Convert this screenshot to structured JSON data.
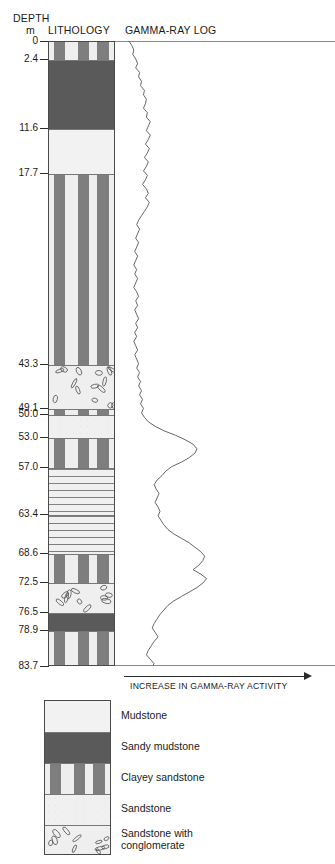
{
  "headers": {
    "depth_title": "DEPTH",
    "depth_unit": "m",
    "lithology_title": "LITHOLOGY",
    "gamma_title": "GAMMA-RAY LOG"
  },
  "axis": {
    "bottom_label": "INCREASE IN GAMMA-RAY ACTIVITY",
    "arrow_icon": "arrow-right-icon"
  },
  "depth_scale": {
    "unit": "m",
    "min": 0,
    "max": 83.7,
    "ticks": [
      "0",
      "2.4",
      "11.6",
      "17.7",
      "43.3",
      "49.1",
      "50.0",
      "53.0",
      "57.0",
      "63.4",
      "68.6",
      "72.5",
      "76.5",
      "78.9",
      "83.7"
    ]
  },
  "lithology": {
    "beds": [
      {
        "top": 0,
        "base": 2.4,
        "type": "Clayey sandstone"
      },
      {
        "top": 2.4,
        "base": 11.6,
        "type": "Sandy mudstone"
      },
      {
        "top": 11.6,
        "base": 17.7,
        "type": "Mudstone"
      },
      {
        "top": 17.7,
        "base": 43.3,
        "type": "Clayey sandstone"
      },
      {
        "top": 43.3,
        "base": 49.1,
        "type": "Sandstone with conglomerate"
      },
      {
        "top": 49.1,
        "base": 50.0,
        "type": "Clayey sandstone"
      },
      {
        "top": 50.0,
        "base": 53.0,
        "type": "Sandstone"
      },
      {
        "top": 53.0,
        "base": 57.0,
        "type": "Clayey sandstone"
      },
      {
        "top": 57.0,
        "base": 63.4,
        "type": "Sandstone"
      },
      {
        "top": 63.4,
        "base": 68.6,
        "type": "Sandstone"
      },
      {
        "top": 68.6,
        "base": 72.5,
        "type": "Clayey sandstone"
      },
      {
        "top": 72.5,
        "base": 76.5,
        "type": "Sandstone with conglomerate"
      },
      {
        "top": 76.5,
        "base": 78.9,
        "type": "Sandy mudstone"
      },
      {
        "top": 78.9,
        "base": 83.7,
        "type": "Clayey sandstone"
      }
    ]
  },
  "legend": {
    "items": [
      {
        "label": "Mudstone",
        "pattern": "mudstone"
      },
      {
        "label": "Sandy mudstone",
        "pattern": "sandy-mudstone"
      },
      {
        "label": "Clayey sandstone",
        "pattern": "clayey-sandstone"
      },
      {
        "label": "Sandstone",
        "pattern": "sandstone"
      },
      {
        "label": "Sandstone with\nconglomerate",
        "pattern": "sandstone-conglomerate"
      }
    ]
  },
  "colors": {
    "mudstone": "#f2f2f2",
    "sandy_mudstone": "#5a5a5a",
    "clayey_sandstone": "#eeeeee",
    "sandstone": "#f0f0f0",
    "conglomerate": "#efefef",
    "curve": "#555555",
    "outline": "#4a4a4a",
    "text": "#1a1a1a"
  },
  "chart_data": {
    "type": "line",
    "title": "GAMMA-RAY LOG",
    "xlabel": "INCREASE IN GAMMA-RAY ACTIVITY",
    "ylabel": "DEPTH (m)",
    "ylim": [
      0,
      83.7
    ],
    "xlim": [
      0,
      100
    ],
    "y_inverted": true,
    "grid": false,
    "legend_position": "none",
    "series": [
      {
        "name": "Gamma-ray",
        "depth_m": [
          0.0,
          0.6,
          1.2,
          1.8,
          2.4,
          3.0,
          3.6,
          4.2,
          4.8,
          5.4,
          6.0,
          6.6,
          7.2,
          7.8,
          8.4,
          9.0,
          9.6,
          10.2,
          10.8,
          11.4,
          12.0,
          12.6,
          13.2,
          13.8,
          14.4,
          15.0,
          15.6,
          16.2,
          16.8,
          17.4,
          18.0,
          18.6,
          19.2,
          19.8,
          20.4,
          21.0,
          21.6,
          22.2,
          22.8,
          23.4,
          24.0,
          24.6,
          25.2,
          25.8,
          26.4,
          27.0,
          27.6,
          28.2,
          28.8,
          29.4,
          30.0,
          30.6,
          31.2,
          31.8,
          32.4,
          33.0,
          33.6,
          34.2,
          34.8,
          35.4,
          36.0,
          36.6,
          37.2,
          37.8,
          38.4,
          39.0,
          39.6,
          40.2,
          40.8,
          41.4,
          42.0,
          42.6,
          43.2,
          43.8,
          44.4,
          45.0,
          45.6,
          46.2,
          46.8,
          47.4,
          48.0,
          48.6,
          49.2,
          49.8,
          50.4,
          51.0,
          51.6,
          52.2,
          52.8,
          53.4,
          54.0,
          54.6,
          55.2,
          55.8,
          56.4,
          57.0,
          57.6,
          58.2,
          58.8,
          59.4,
          60.0,
          60.6,
          61.2,
          61.8,
          62.4,
          63.0,
          63.6,
          64.2,
          64.8,
          65.4,
          66.0,
          66.6,
          67.2,
          67.8,
          68.4,
          69.0,
          69.6,
          70.2,
          70.8,
          71.4,
          72.0,
          72.6,
          73.2,
          73.8,
          74.4,
          75.0,
          75.6,
          76.2,
          76.8,
          77.4,
          78.0,
          78.6,
          79.2,
          79.8,
          80.4,
          81.0,
          81.6,
          82.2,
          82.8,
          83.4,
          83.7
        ],
        "values": [
          4,
          7,
          9,
          8,
          11,
          13,
          11,
          15,
          14,
          17,
          16,
          20,
          19,
          22,
          21,
          19,
          23,
          22,
          26,
          24,
          22,
          26,
          24,
          21,
          25,
          23,
          20,
          24,
          22,
          19,
          23,
          21,
          18,
          22,
          24,
          21,
          25,
          23,
          20,
          17,
          14,
          12,
          15,
          13,
          11,
          14,
          12,
          10,
          13,
          11,
          9,
          12,
          10,
          13,
          11,
          9,
          12,
          14,
          11,
          13,
          10,
          12,
          14,
          11,
          13,
          10,
          12,
          9,
          11,
          13,
          10,
          12,
          14,
          12,
          15,
          13,
          16,
          14,
          17,
          15,
          18,
          16,
          19,
          17,
          20,
          24,
          31,
          40,
          52,
          62,
          70,
          74,
          72,
          66,
          58,
          48,
          42,
          38,
          33,
          30,
          32,
          35,
          33,
          31,
          34,
          36,
          34,
          37,
          40,
          44,
          50,
          58,
          66,
          72,
          78,
          82,
          80,
          76,
          70,
          78,
          84,
          80,
          74,
          66,
          58,
          50,
          44,
          40,
          36,
          33,
          30,
          28,
          31,
          34,
          30,
          27,
          24,
          22,
          26,
          30,
          28,
          32,
          30,
          26,
          22,
          24,
          28,
          26,
          30,
          34,
          32,
          36,
          40,
          44,
          42,
          46,
          50,
          54,
          58,
          62,
          60,
          56,
          52,
          48,
          44,
          40,
          36,
          32,
          28,
          26,
          30,
          34,
          38,
          42,
          46,
          50,
          48,
          52,
          56,
          60,
          58,
          54,
          50,
          46,
          42,
          38,
          34,
          30,
          26,
          22,
          20,
          24,
          28,
          32,
          36,
          40,
          38,
          42,
          46,
          50,
          48,
          44,
          40,
          36,
          32,
          28,
          26,
          30,
          34,
          38,
          36,
          40,
          44,
          42,
          46,
          50,
          48,
          44,
          40,
          36,
          34,
          38,
          42,
          46,
          44,
          48,
          52,
          50,
          46,
          42,
          38,
          34,
          30,
          28,
          32,
          36,
          40,
          38,
          42,
          46,
          44,
          40,
          36,
          32,
          30,
          34,
          38,
          42,
          40,
          44,
          48,
          46,
          42,
          38,
          34,
          32,
          36,
          40,
          44,
          42,
          46,
          50,
          48,
          44,
          40,
          36,
          34,
          30,
          28,
          32,
          36,
          34,
          38,
          42,
          40,
          44,
          48,
          46,
          50,
          54,
          52,
          48,
          44,
          40,
          38,
          42,
          46,
          44,
          40,
          36,
          32,
          30,
          34,
          38,
          36,
          40,
          44,
          42,
          46,
          50,
          48,
          44,
          40,
          38,
          34,
          30,
          28,
          32,
          30,
          34,
          38,
          36,
          40,
          44,
          42,
          38,
          34,
          30,
          28,
          32,
          36,
          34,
          30,
          26,
          24,
          28,
          32,
          30,
          34,
          38,
          36,
          32,
          28,
          24,
          22,
          26,
          30,
          28,
          24,
          20,
          18,
          22,
          26,
          24,
          20,
          16,
          14,
          18,
          22,
          20,
          16,
          12,
          10,
          14,
          18,
          16,
          12,
          8
        ]
      }
    ]
  }
}
